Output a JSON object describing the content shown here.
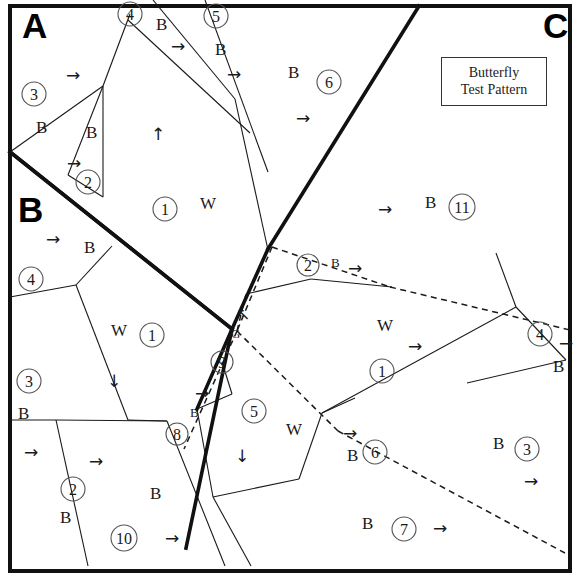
{
  "figure": {
    "legend": {
      "line1": "Butterfly",
      "line2": "Test Pattern"
    },
    "zone_labels": [
      {
        "name": "zone-a",
        "text": "A",
        "x": 22,
        "y": 38
      },
      {
        "name": "zone-b",
        "text": "B",
        "x": 18,
        "y": 222
      },
      {
        "name": "zone-c",
        "text": "C",
        "x": 543,
        "y": 38
      }
    ],
    "fill_codes": [
      {
        "text": "B",
        "x": 36,
        "y": 133,
        "size": "normal"
      },
      {
        "text": "B",
        "x": 86,
        "y": 138,
        "size": "normal"
      },
      {
        "text": "B",
        "x": 156,
        "y": 30,
        "size": "normal"
      },
      {
        "text": "B",
        "x": 215,
        "y": 55,
        "size": "normal"
      },
      {
        "text": "B",
        "x": 288,
        "y": 78,
        "size": "normal"
      },
      {
        "text": "W",
        "x": 200,
        "y": 209,
        "size": "normal"
      },
      {
        "text": "B",
        "x": 425,
        "y": 208,
        "size": "normal"
      },
      {
        "text": "B",
        "x": 84,
        "y": 253,
        "size": "normal"
      },
      {
        "text": "W",
        "x": 111,
        "y": 336,
        "size": "normal"
      },
      {
        "text": "B",
        "x": 18,
        "y": 419,
        "size": "normal"
      },
      {
        "text": "B",
        "x": 60,
        "y": 523,
        "size": "normal"
      },
      {
        "text": "B",
        "x": 150,
        "y": 499,
        "size": "normal"
      },
      {
        "text": "G",
        "x": 231,
        "y": 338,
        "size": "small"
      },
      {
        "text": "B",
        "x": 190,
        "y": 417,
        "size": "small"
      },
      {
        "text": "B",
        "x": 331,
        "y": 267,
        "size": "small"
      },
      {
        "text": "W",
        "x": 377,
        "y": 331,
        "size": "normal"
      },
      {
        "text": "W",
        "x": 286,
        "y": 435,
        "size": "normal"
      },
      {
        "text": "B",
        "x": 347,
        "y": 461,
        "size": "normal"
      },
      {
        "text": "B",
        "x": 553,
        "y": 372,
        "size": "normal"
      },
      {
        "text": "B",
        "x": 493,
        "y": 449,
        "size": "normal"
      },
      {
        "text": "B",
        "x": 362,
        "y": 529,
        "size": "normal"
      }
    ],
    "region_markers": [
      {
        "id": "3",
        "cx": 34,
        "cy": 94,
        "r": 12
      },
      {
        "id": "4",
        "cx": 130,
        "cy": 14,
        "r": 12
      },
      {
        "id": "5",
        "cx": 216,
        "cy": 16,
        "r": 12
      },
      {
        "id": "6",
        "cx": 329,
        "cy": 82,
        "r": 12
      },
      {
        "id": "2",
        "cx": 88,
        "cy": 182,
        "r": 12
      },
      {
        "id": "1",
        "cx": 165,
        "cy": 209,
        "r": 12
      },
      {
        "id": "11",
        "cx": 462,
        "cy": 207,
        "r": 13
      },
      {
        "id": "4",
        "cx": 31,
        "cy": 279,
        "r": 12
      },
      {
        "id": "1",
        "cx": 152,
        "cy": 335,
        "r": 12
      },
      {
        "id": "3",
        "cx": 29,
        "cy": 381,
        "r": 12
      },
      {
        "id": "2",
        "cx": 73,
        "cy": 489,
        "r": 12
      },
      {
        "id": "10",
        "cx": 124,
        "cy": 538,
        "r": 13
      },
      {
        "id": "9",
        "cx": 222,
        "cy": 362,
        "r": 11
      },
      {
        "id": "8",
        "cx": 177,
        "cy": 434,
        "r": 11
      },
      {
        "id": "2",
        "cx": 308,
        "cy": 265,
        "r": 11
      },
      {
        "id": "5",
        "cx": 254,
        "cy": 411,
        "r": 12
      },
      {
        "id": "1",
        "cx": 382,
        "cy": 371,
        "r": 12
      },
      {
        "id": "6",
        "cx": 375,
        "cy": 452,
        "r": 12
      },
      {
        "id": "4",
        "cx": 540,
        "cy": 334,
        "r": 12
      },
      {
        "id": "3",
        "cx": 527,
        "cy": 449,
        "r": 12
      },
      {
        "id": "7",
        "cx": 404,
        "cy": 529,
        "r": 12
      }
    ],
    "direction_arrows": [
      {
        "dir": "right",
        "x": 73,
        "y": 75
      },
      {
        "dir": "right",
        "x": 74,
        "y": 163
      },
      {
        "dir": "right",
        "x": 178,
        "y": 46
      },
      {
        "dir": "right",
        "x": 234,
        "y": 74
      },
      {
        "dir": "right",
        "x": 303,
        "y": 118
      },
      {
        "dir": "up",
        "x": 158,
        "y": 134
      },
      {
        "dir": "right",
        "x": 385,
        "y": 209
      },
      {
        "dir": "right",
        "x": 53,
        "y": 239
      },
      {
        "dir": "down",
        "x": 114,
        "y": 381
      },
      {
        "dir": "right",
        "x": 31,
        "y": 452
      },
      {
        "dir": "right",
        "x": 96,
        "y": 461
      },
      {
        "dir": "right",
        "x": 172,
        "y": 538
      },
      {
        "dir": "upleft",
        "x": 243,
        "y": 314
      },
      {
        "dir": "right",
        "x": 202,
        "y": 393
      },
      {
        "dir": "right",
        "x": 355,
        "y": 268
      },
      {
        "dir": "right",
        "x": 415,
        "y": 346
      },
      {
        "dir": "down",
        "x": 242,
        "y": 456
      },
      {
        "dir": "right",
        "x": 350,
        "y": 433
      },
      {
        "dir": "right",
        "x": 566,
        "y": 343
      },
      {
        "dir": "right",
        "x": 531,
        "y": 481
      },
      {
        "dir": "right",
        "x": 440,
        "y": 528
      }
    ],
    "frame": {
      "left": 10,
      "top": 6,
      "right": 570,
      "bottom": 571
    },
    "major_lines": [
      {
        "name": "butterfly-upper-right",
        "points": "419,6 268,249"
      },
      {
        "name": "butterfly-upper-left",
        "points": "10,152 232,329"
      },
      {
        "name": "butterfly-lower-left",
        "points": "232,329 186,548"
      },
      {
        "name": "butterfly-lower-right",
        "points": "268,249 232,329"
      },
      {
        "name": "zone-b-divider",
        "points": "10,152 232,329"
      },
      {
        "name": "center-spur",
        "points": "232,329 197,409"
      }
    ],
    "minor_lines": [
      {
        "name": "ln-a1",
        "points": "10,152 103,86"
      },
      {
        "name": "ln-a2",
        "points": "103,86 103,197"
      },
      {
        "name": "ln-a3",
        "points": "103,86 130,14"
      },
      {
        "name": "ln-a4",
        "points": "128,20 250,133"
      },
      {
        "name": "ln-a5",
        "points": "153,0 235,99"
      },
      {
        "name": "ln-a6",
        "points": "205,0 268,172"
      },
      {
        "name": "ln-a7",
        "points": "235,99 268,250"
      },
      {
        "name": "ln-a8",
        "points": "103,197 68,175"
      },
      {
        "name": "ln-a9",
        "points": "68,175 103,86"
      },
      {
        "name": "ln-b1",
        "points": "10,297 76,285"
      },
      {
        "name": "ln-b2",
        "points": "76,285 128,420"
      },
      {
        "name": "ln-b3",
        "points": "76,285 112,246"
      },
      {
        "name": "ln-b4",
        "points": "56,420 167,421"
      },
      {
        "name": "ln-b5",
        "points": "56,420 88,566"
      },
      {
        "name": "ln-b6",
        "points": "10,420 56,420"
      },
      {
        "name": "ln-b7",
        "points": "128,420 167,421"
      },
      {
        "name": "ln-b8",
        "points": "167,421 225,566"
      },
      {
        "name": "ln-c1",
        "points": "311,279 246,294"
      },
      {
        "name": "ln-c2",
        "points": "311,279 392,287"
      },
      {
        "name": "ln-c3",
        "points": "516,307 322,413"
      },
      {
        "name": "ln-c4",
        "points": "516,307 566,360"
      },
      {
        "name": "ln-c5",
        "points": "516,307 496,253"
      },
      {
        "name": "ln-c6",
        "points": "566,360 467,383"
      },
      {
        "name": "ln-c7",
        "points": "322,413 299,479"
      },
      {
        "name": "ln-c8",
        "points": "322,413 355,398"
      },
      {
        "name": "ln-c9",
        "points": "299,479 213,497"
      },
      {
        "name": "ln-c10",
        "points": "213,497 251,566"
      },
      {
        "name": "ln-c11",
        "points": "213,497 197,409"
      },
      {
        "name": "ln-d1",
        "points": "197,409 232,394"
      },
      {
        "name": "ln-d2",
        "points": "232,394 222,362"
      }
    ],
    "dashed_lines": [
      {
        "name": "dash-top",
        "points": "272,247 390,287"
      },
      {
        "name": "dash-right-edge",
        "points": "390,287 570,330"
      },
      {
        "name": "dash-left-edge",
        "points": "272,247 237,331"
      },
      {
        "name": "dash-spine",
        "points": "237,331 184,449"
      },
      {
        "name": "dash-v-drop",
        "points": "237,331 338,431"
      },
      {
        "name": "dash-tail",
        "points": "338,431 565,553"
      },
      {
        "name": "dash-stub",
        "points": "237,331 246,294"
      }
    ]
  }
}
